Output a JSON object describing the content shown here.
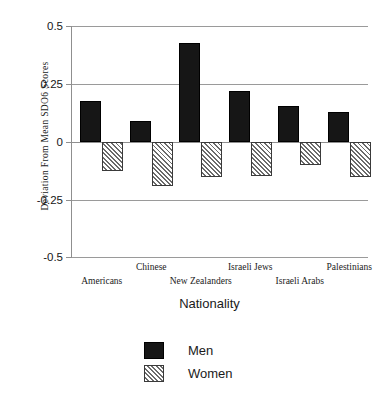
{
  "chart_data": {
    "type": "bar",
    "title": "",
    "xlabel": "Nationality",
    "ylabel": "Deviation From Mean SDO6 Scores",
    "categories": [
      "Americans",
      "Chinese",
      "New Zealanders",
      "Israeli Jews",
      "Israeli Arabs",
      "Palestinians"
    ],
    "series": [
      {
        "name": "Men",
        "values": [
          0.175,
          0.09,
          0.425,
          0.22,
          0.155,
          0.13
        ]
      },
      {
        "name": "Women",
        "values": [
          -0.125,
          -0.19,
          -0.15,
          -0.145,
          -0.1,
          -0.15
        ]
      }
    ],
    "ylim": [
      -0.5,
      0.5
    ],
    "yticks": [
      0.5,
      0.25,
      0,
      -0.25,
      -0.5
    ],
    "ytick_labels": [
      "0.5",
      "0.25",
      "0",
      "-0.25",
      "-0.5"
    ],
    "grid": true,
    "legend_position": "bottom-center",
    "legend_entries": [
      {
        "label": "Men",
        "swatch": "solid-black"
      },
      {
        "label": "Women",
        "swatch": "diagonal-hatch"
      }
    ]
  },
  "axes": {
    "y_title": "Deviation From Mean SDO6 Scores",
    "x_title": "Nationality",
    "y_tick_labels": [
      "0.5",
      "0.25",
      "0",
      "-0.25",
      "-0.5"
    ],
    "x_tick_labels": [
      "Americans",
      "Chinese",
      "New Zealanders",
      "Israeli Jews",
      "Israeli Arabs",
      "Palestinians"
    ]
  },
  "legend": {
    "men_label": "Men",
    "women_label": "Women"
  },
  "colors": {
    "men_fill": "#161616",
    "women_fill": "#ffffff",
    "women_hatch": "#6b6b6b",
    "gridline": "#9a9a9a",
    "text": "#1a1a1a",
    "background": "#ffffff"
  }
}
